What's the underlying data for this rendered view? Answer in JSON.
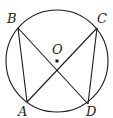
{
  "diagram": {
    "type": "circle-geometry",
    "circle": {
      "center": "O",
      "cx": 57,
      "cy": 61,
      "r": 51
    },
    "points": {
      "O": {
        "label": "O",
        "x": 57,
        "y": 61
      },
      "B": {
        "label": "B",
        "x": 18,
        "y": 28
      },
      "C": {
        "label": "C",
        "x": 97,
        "y": 28
      },
      "A": {
        "label": "A",
        "x": 27,
        "y": 102
      },
      "D": {
        "label": "D",
        "x": 88,
        "y": 104
      }
    },
    "segments": [
      [
        "B",
        "A"
      ],
      [
        "B",
        "D"
      ],
      [
        "C",
        "A"
      ],
      [
        "C",
        "D"
      ]
    ],
    "colors": {
      "stroke": "#1a1a1a",
      "background": "#ffffff"
    }
  }
}
